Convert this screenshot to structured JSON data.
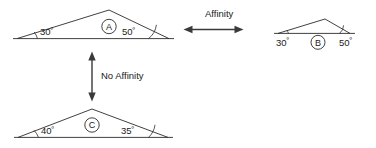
{
  "figure": {
    "background_color": "#ffffff",
    "line_color": "#2b2b2b",
    "arrow_color": "#3a3a3a"
  },
  "triangles": [
    {
      "id": "A",
      "letter": "A",
      "position": "top-left",
      "angles": [
        {
          "label": "30",
          "degree_symbol": "º",
          "vertex": "left"
        },
        {
          "label": "50",
          "degree_symbol": "º",
          "vertex": "right"
        }
      ],
      "vertices": {
        "left": [
          17,
          38
        ],
        "apex": [
          109,
          10
        ],
        "right": [
          169,
          38
        ]
      }
    },
    {
      "id": "B",
      "letter": "B",
      "position": "top-right",
      "angles": [
        {
          "label": "30",
          "degree_symbol": "º",
          "vertex": "left"
        },
        {
          "label": "50",
          "degree_symbol": "º",
          "vertex": "right"
        }
      ],
      "vertices": {
        "left": [
          278,
          33
        ],
        "apex": [
          325,
          19
        ],
        "right": [
          350,
          33
        ]
      }
    },
    {
      "id": "C",
      "letter": "C",
      "position": "bottom-left",
      "angles": [
        {
          "label": "40",
          "degree_symbol": "º",
          "vertex": "left"
        },
        {
          "label": "35",
          "degree_symbol": "º",
          "vertex": "right"
        }
      ],
      "vertices": {
        "left": [
          18,
          137
        ],
        "apex": [
          92,
          109
        ],
        "right": [
          168,
          137
        ]
      }
    }
  ],
  "relations": [
    {
      "id": "affinity",
      "label": "Affinity",
      "direction": "horizontal-double",
      "from": "A",
      "to": "B"
    },
    {
      "id": "no-affinity",
      "label": "No Affinity",
      "direction": "vertical-double",
      "from": "A",
      "to": "C"
    }
  ]
}
